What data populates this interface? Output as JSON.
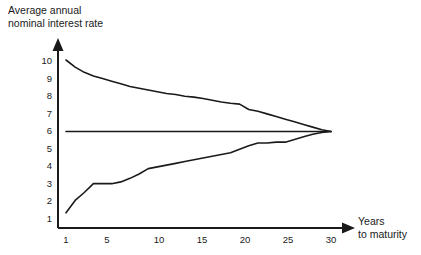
{
  "chart_data": {
    "type": "line",
    "title": "Average annual nominal interest rate",
    "title_lines": [
      "Average annual",
      "nominal interest rate"
    ],
    "xlabel": "Years to maturity",
    "xlabel_lines": [
      "Years",
      "to maturity"
    ],
    "ylabel": "",
    "xlim": [
      0,
      31
    ],
    "ylim": [
      0,
      10.6
    ],
    "grid": false,
    "legend": "none",
    "xticks": [
      1,
      5,
      10,
      15,
      20,
      25,
      30
    ],
    "xtick_labels": [
      "1",
      "5",
      "10",
      "15",
      "20",
      "25",
      "30"
    ],
    "yticks": [
      1,
      2,
      3,
      4,
      5,
      6,
      7,
      8,
      9,
      10
    ],
    "ytick_labels": [
      "1",
      "2",
      "3",
      "4",
      "5",
      "6",
      "7",
      "8",
      "9",
      "10"
    ],
    "line_color": "#1a1a1a",
    "axis_color": "#1a1a1a",
    "series": [
      {
        "name": "downward-sloping yield curve",
        "x": [
          1,
          2,
          3,
          4,
          5,
          6,
          7,
          8,
          9,
          10,
          11,
          12,
          13,
          14,
          15,
          16,
          17,
          18,
          19,
          20,
          21,
          22,
          23,
          24,
          25,
          26,
          27,
          28,
          29,
          30
        ],
        "values": [
          10.0,
          9.6,
          9.3,
          9.1,
          8.95,
          8.8,
          8.65,
          8.5,
          8.4,
          8.3,
          8.2,
          8.1,
          8.05,
          7.95,
          7.9,
          7.82,
          7.72,
          7.62,
          7.55,
          7.5,
          7.2,
          7.1,
          6.95,
          6.8,
          6.65,
          6.5,
          6.35,
          6.2,
          6.05,
          5.95
        ]
      },
      {
        "name": "flat yield curve",
        "x": [
          1,
          5,
          10,
          15,
          20,
          25,
          28,
          29,
          30
        ],
        "values": [
          5.95,
          5.95,
          5.95,
          5.95,
          5.95,
          5.95,
          5.95,
          5.95,
          5.95
        ]
      },
      {
        "name": "upward-sloping yield curve",
        "x": [
          1,
          2,
          3,
          4,
          5,
          6,
          7,
          8,
          9,
          10,
          11,
          12,
          13,
          14,
          15,
          16,
          17,
          18,
          19,
          20,
          21,
          22,
          23,
          24,
          25,
          26,
          27,
          28,
          29,
          30
        ],
        "values": [
          1.35,
          2.05,
          2.5,
          3.0,
          3.0,
          3.0,
          3.1,
          3.3,
          3.55,
          3.85,
          3.95,
          4.05,
          4.15,
          4.25,
          4.35,
          4.45,
          4.55,
          4.65,
          4.75,
          4.95,
          5.15,
          5.3,
          5.3,
          5.35,
          5.35,
          5.5,
          5.65,
          5.8,
          5.9,
          5.95
        ]
      }
    ]
  }
}
